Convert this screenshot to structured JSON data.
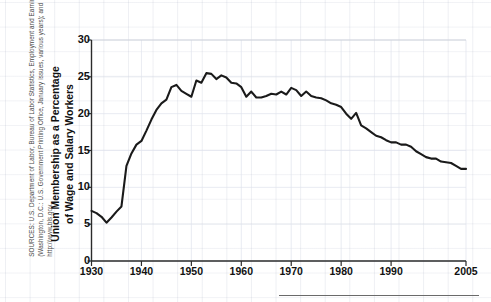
{
  "figure": {
    "source_note": "SOURCES: U.S. Department of Labor, Bureau of Labor Statistics, Employment and Earnings (Washington, D.C.: U.S. Government Printing Office, January issues, various years); and http://www.bls.gov.",
    "y_axis_title_line1": "Union Membership as a Percentage",
    "y_axis_title_line2": "of Wage and Salary Workers"
  },
  "chart_data": {
    "type": "line",
    "title": "",
    "xlabel": "",
    "ylabel": "Union Membership as a Percentage of Wage and Salary Workers",
    "xlim": [
      1930,
      2005
    ],
    "ylim": [
      0,
      30
    ],
    "grid": true,
    "legend": "none",
    "line_color": "#1a1a1a",
    "xticks": [
      1930,
      1940,
      1950,
      1960,
      1970,
      1980,
      1990,
      2005
    ],
    "xtick_labels": [
      "1930",
      "1940",
      "1950",
      "1960",
      "1970",
      "1980",
      "1990",
      "2005"
    ],
    "yticks": [
      0,
      5,
      10,
      15,
      20,
      25,
      30
    ],
    "ytick_labels": [
      "0",
      "5",
      "10",
      "15",
      "20",
      "25",
      "30"
    ],
    "series": [
      {
        "name": "Union membership",
        "x": [
          1930,
          1931,
          1932,
          1933,
          1934,
          1935,
          1936,
          1937,
          1938,
          1939,
          1940,
          1941,
          1942,
          1943,
          1944,
          1945,
          1946,
          1947,
          1948,
          1949,
          1950,
          1951,
          1952,
          1953,
          1954,
          1955,
          1956,
          1957,
          1958,
          1959,
          1960,
          1961,
          1962,
          1963,
          1964,
          1965,
          1966,
          1967,
          1968,
          1969,
          1970,
          1971,
          1972,
          1973,
          1974,
          1975,
          1976,
          1977,
          1978,
          1979,
          1980,
          1981,
          1982,
          1983,
          1984,
          1985,
          1986,
          1987,
          1988,
          1989,
          1990,
          1991,
          1992,
          1993,
          1994,
          1995,
          1996,
          1997,
          1998,
          1999,
          2000,
          2001,
          2002,
          2003,
          2004,
          2005
        ],
        "values": [
          6.8,
          6.5,
          6.0,
          5.2,
          5.9,
          6.7,
          7.4,
          12.9,
          14.6,
          15.8,
          16.3,
          17.7,
          19.2,
          20.5,
          21.4,
          21.9,
          23.6,
          23.9,
          23.1,
          22.7,
          22.3,
          24.5,
          24.2,
          25.5,
          25.4,
          24.7,
          25.2,
          24.9,
          24.2,
          24.1,
          23.6,
          22.3,
          23.0,
          22.2,
          22.2,
          22.4,
          22.7,
          22.6,
          23.0,
          22.6,
          23.5,
          23.2,
          22.4,
          23.0,
          22.4,
          22.2,
          22.1,
          21.8,
          21.4,
          21.2,
          20.9,
          20.0,
          19.3,
          20.1,
          18.4,
          18.0,
          17.5,
          17.0,
          16.8,
          16.4,
          16.1,
          16.1,
          15.8,
          15.8,
          15.5,
          14.9,
          14.5,
          14.1,
          13.9,
          13.9,
          13.5,
          13.4,
          13.3,
          12.9,
          12.5,
          12.5
        ]
      }
    ]
  }
}
